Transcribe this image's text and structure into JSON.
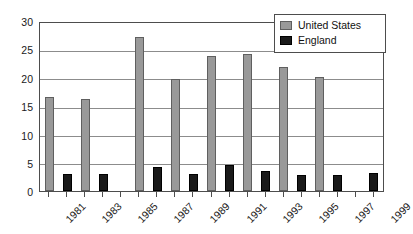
{
  "chart_data": {
    "type": "bar",
    "title": "",
    "xlabel": "",
    "ylabel": "",
    "ylim": [
      0,
      30
    ],
    "yticks": [
      0,
      5,
      10,
      15,
      20,
      25,
      30
    ],
    "grid": true,
    "legend_position": "top-right",
    "x": [
      1981,
      1982,
      1983,
      1984,
      1985,
      1986,
      1987,
      1988,
      1989,
      1990,
      1991,
      1992,
      1993,
      1994,
      1995,
      1996,
      1997,
      1998,
      1999
    ],
    "x_tick_labels": [
      "1981",
      "1983",
      "1985",
      "1987",
      "1989",
      "1991",
      "1993",
      "1995",
      "1997",
      "1999"
    ],
    "series": [
      {
        "name": "United States",
        "color": "#999999",
        "values": [
          16.8,
          null,
          16.5,
          null,
          null,
          27.5,
          null,
          20.0,
          null,
          24.1,
          null,
          24.5,
          null,
          22.2,
          null,
          20.3,
          null,
          null,
          null
        ]
      },
      {
        "name": "England",
        "color": "#1a1a1a",
        "values": [
          null,
          3.0,
          null,
          3.0,
          null,
          null,
          4.2,
          null,
          3.1,
          null,
          4.6,
          null,
          3.6,
          null,
          2.8,
          null,
          2.9,
          null,
          3.2
        ]
      }
    ]
  },
  "legend": {
    "items": [
      {
        "label": "United States",
        "swatch": "us"
      },
      {
        "label": "England",
        "swatch": "eng"
      }
    ]
  },
  "axis": {
    "y_labels": [
      "30",
      "25",
      "20",
      "15",
      "10",
      "5",
      "0"
    ],
    "x_labels": [
      "1981",
      "1983",
      "1985",
      "1987",
      "1989",
      "1991",
      "1993",
      "1995",
      "1997",
      "1999"
    ]
  }
}
